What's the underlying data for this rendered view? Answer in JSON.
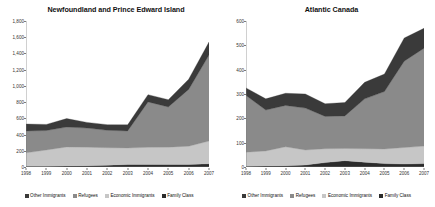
{
  "figure": {
    "background": "#ffffff",
    "width": 435,
    "height": 207
  },
  "series_colors": {
    "other_immigrants": "#3a3a3a",
    "refugees": "#8a8a8a",
    "economic_immigrants": "#c6c6c6",
    "family_class": "#2b2b2b"
  },
  "legend": {
    "items": [
      {
        "label": "Other Immigrants",
        "color": "#3a3a3a"
      },
      {
        "label": "Refugees",
        "color": "#8a8a8a"
      },
      {
        "label": "Economic Immigrants",
        "color": "#c6c6c6"
      },
      {
        "label": "Family Class",
        "color": "#2b2b2b"
      }
    ]
  },
  "chart_data": [
    {
      "type": "area",
      "stacked": true,
      "panel": "left",
      "title": "Newfoundland and Prince Edward Island",
      "xlabel": "",
      "ylabel": "",
      "x": [
        1998,
        1999,
        2000,
        2001,
        2002,
        2003,
        2004,
        2005,
        2006,
        2007
      ],
      "xtick_labels": [
        "1998",
        "1999",
        "2000",
        "2001",
        "2002",
        "2003",
        "2004",
        "2005",
        "2006",
        "2007"
      ],
      "ylim": [
        0,
        1800
      ],
      "ytick_values": [
        0,
        200,
        400,
        600,
        800,
        1000,
        1200,
        1400,
        1600,
        1800
      ],
      "ytick_labels": [
        "0",
        "200",
        "400",
        "600",
        "800",
        "1,000",
        "1,200",
        "1,400",
        "1,600",
        "1,800"
      ],
      "grid": false,
      "legend_position": "bottom",
      "stack_order_bottom_to_top": [
        "Family Class",
        "Economic Immigrants",
        "Refugees",
        "Other Immigrants"
      ],
      "series": [
        {
          "name": "Family Class",
          "color": "#2b2b2b",
          "values": [
            10,
            10,
            12,
            15,
            22,
            30,
            32,
            30,
            32,
            40
          ]
        },
        {
          "name": "Economic Immigrants",
          "color": "#c6c6c6",
          "values": [
            165,
            200,
            235,
            230,
            215,
            205,
            210,
            215,
            225,
            280
          ]
        },
        {
          "name": "Refugees",
          "color": "#8a8a8a",
          "values": [
            270,
            240,
            245,
            235,
            215,
            210,
            560,
            495,
            700,
            1060
          ]
        },
        {
          "name": "Other Immigrants",
          "color": "#3a3a3a",
          "values": [
            85,
            75,
            105,
            70,
            70,
            75,
            90,
            90,
            125,
            160
          ]
        }
      ],
      "totals": [
        530,
        525,
        597,
        550,
        522,
        520,
        892,
        830,
        1082,
        1540
      ]
    },
    {
      "type": "area",
      "stacked": true,
      "panel": "right",
      "title": "Atlantic Canada",
      "xlabel": "",
      "ylabel": "",
      "x": [
        1998,
        1999,
        2000,
        2001,
        2002,
        2003,
        2004,
        2005,
        2006,
        2007
      ],
      "xtick_labels": [
        "1998",
        "1999",
        "2000",
        "2001",
        "2002",
        "2003",
        "2004",
        "2005",
        "2006",
        "2007"
      ],
      "ylim": [
        0,
        600
      ],
      "ytick_values": [
        0,
        100,
        200,
        300,
        400,
        500,
        600
      ],
      "ytick_labels": [
        "0",
        "100",
        "200",
        "300",
        "400",
        "500",
        "600"
      ],
      "grid": false,
      "legend_position": "bottom",
      "stack_order_bottom_to_top": [
        "Family Class",
        "Economic Immigrants",
        "Refugees",
        "Other Immigrants"
      ],
      "series": [
        {
          "name": "Family Class",
          "color": "#2b2b2b",
          "values": [
            3,
            4,
            5,
            8,
            18,
            26,
            20,
            14,
            12,
            14
          ]
        },
        {
          "name": "Economic Immigrants",
          "color": "#c6c6c6",
          "values": [
            58,
            62,
            78,
            62,
            57,
            50,
            55,
            60,
            68,
            72
          ]
        },
        {
          "name": "Refugees",
          "color": "#8a8a8a",
          "values": [
            233,
            168,
            170,
            172,
            133,
            134,
            205,
            236,
            355,
            402
          ]
        },
        {
          "name": "Other Immigrants",
          "color": "#3a3a3a",
          "values": [
            31,
            46,
            50,
            58,
            52,
            55,
            68,
            72,
            95,
            82
          ]
        }
      ],
      "totals": [
        325,
        280,
        303,
        300,
        260,
        265,
        348,
        382,
        530,
        570
      ]
    }
  ]
}
